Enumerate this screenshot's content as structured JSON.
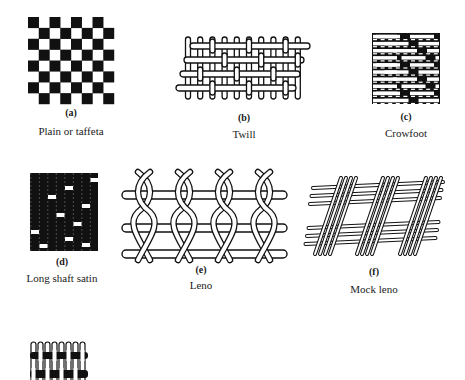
{
  "figure": {
    "panels": [
      {
        "id": "a",
        "letter": "(a)",
        "caption": "Plain or taffeta"
      },
      {
        "id": "b",
        "letter": "(b)",
        "caption": "Twill"
      },
      {
        "id": "c",
        "letter": "(c)",
        "caption": "Crowfoot"
      },
      {
        "id": "d",
        "letter": "(d)",
        "caption": "Long shaft satin"
      },
      {
        "id": "e",
        "letter": "(e)",
        "caption": "Leno"
      },
      {
        "id": "f",
        "letter": "(f)",
        "caption": "Mock leno"
      },
      {
        "id": "g",
        "letter": "",
        "caption": ""
      }
    ],
    "colors": {
      "ink": "#111111",
      "paper": "#ffffff"
    }
  }
}
